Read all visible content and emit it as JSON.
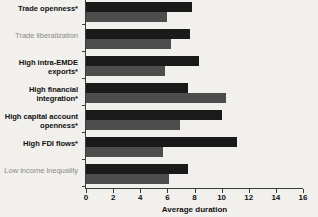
{
  "chart_data": {
    "type": "bar",
    "orientation": "horizontal",
    "title": "",
    "xlabel": "Average duration",
    "ylabel": "",
    "xlim": [
      0,
      16
    ],
    "xticks": [
      0,
      2,
      4,
      6,
      8,
      10,
      12,
      14,
      16
    ],
    "grid": false,
    "legend": "none",
    "categories": [
      "Trade openness*",
      "Trade liberalization",
      "High intra-EMDE exports*",
      "High financial integration*",
      "High capital account openness*",
      "High FDI flows*",
      "Low income inequality"
    ],
    "category_emphasis": [
      true,
      false,
      true,
      true,
      true,
      true,
      false
    ],
    "series": [
      {
        "name": "dark",
        "color": "#1a1a1a",
        "values": [
          7.8,
          7.7,
          8.3,
          7.5,
          10.0,
          11.1,
          7.5
        ]
      },
      {
        "name": "light",
        "color": "#4d4d4d",
        "values": [
          6.0,
          6.3,
          5.8,
          10.3,
          6.9,
          5.7,
          6.1
        ]
      }
    ]
  },
  "axis": {
    "x_title": "Average duration",
    "x_tick_labels": [
      "0",
      "2",
      "4",
      "6",
      "8",
      "10",
      "12",
      "14",
      "16"
    ]
  },
  "colors": {
    "background": "#f2f0ed",
    "bar_dark": "#1a1a1a",
    "bar_light": "#4d4d4d",
    "label_bold": "#111111",
    "label_muted": "#8a8a8a",
    "axis": "#3a3a3a"
  }
}
